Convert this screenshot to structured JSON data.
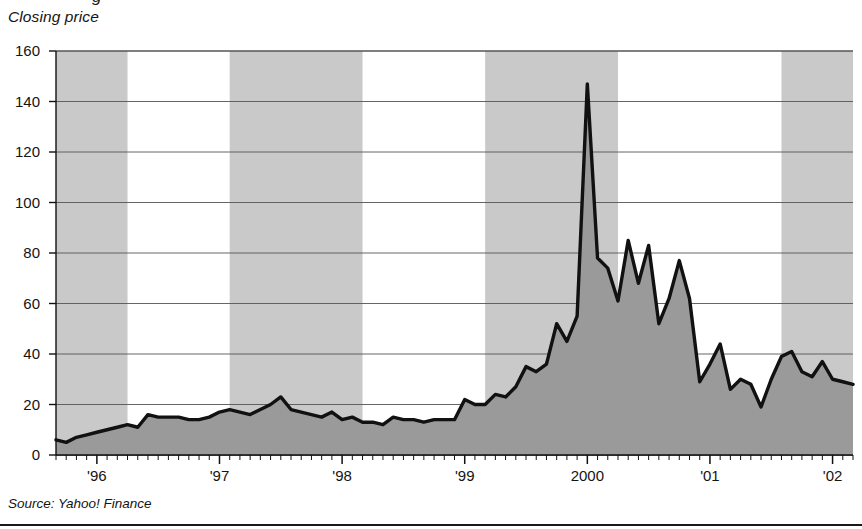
{
  "axis_label": "Closing price",
  "source": "Source: Yahoo! Finance",
  "yticks": [
    "0",
    "20",
    "40",
    "60",
    "80",
    "100",
    "120",
    "140",
    "160"
  ],
  "xticks": [
    "'96",
    "'97",
    "'98",
    "'99",
    "2000",
    "'01",
    "'02"
  ],
  "colors": {
    "band": "#c9c9c9",
    "area_fill": "#9a9a9a",
    "line": "#111111",
    "gridline": "#555555",
    "axis": "#111111",
    "text": "#141414",
    "background": "#ffffff"
  },
  "chart_data": {
    "type": "area",
    "title": "Closing price",
    "xlabel": "",
    "ylabel": "Closing price",
    "ylim": [
      0,
      160
    ],
    "ytick_values": [
      0,
      20,
      40,
      60,
      80,
      100,
      120,
      140,
      160
    ],
    "grid": true,
    "legend": "none",
    "xlim": [
      "1995-09",
      "2002-03"
    ],
    "xtick_labels": [
      "'96",
      "'97",
      "'98",
      "'99",
      "2000",
      "'01",
      "'02"
    ],
    "xtick_positions": [
      "1996-01",
      "1997-01",
      "1998-01",
      "1999-01",
      "2000-01",
      "2001-01",
      "2002-01"
    ],
    "shaded_bands": [
      {
        "start": "1995-09",
        "end": "1996-04"
      },
      {
        "start": "1997-02",
        "end": "1998-03"
      },
      {
        "start": "1999-03",
        "end": "2000-04"
      },
      {
        "start": "2001-08",
        "end": "2002-03"
      }
    ],
    "x": [
      "1995-09",
      "1995-10",
      "1995-11",
      "1995-12",
      "1996-01",
      "1996-02",
      "1996-03",
      "1996-04",
      "1996-05",
      "1996-06",
      "1996-07",
      "1996-08",
      "1996-09",
      "1996-10",
      "1996-11",
      "1996-12",
      "1997-01",
      "1997-02",
      "1997-03",
      "1997-04",
      "1997-05",
      "1997-06",
      "1997-07",
      "1997-08",
      "1997-09",
      "1997-10",
      "1997-11",
      "1997-12",
      "1998-01",
      "1998-02",
      "1998-03",
      "1998-04",
      "1998-05",
      "1998-06",
      "1998-07",
      "1998-08",
      "1998-09",
      "1998-10",
      "1998-11",
      "1998-12",
      "1999-01",
      "1999-02",
      "1999-03",
      "1999-04",
      "1999-05",
      "1999-06",
      "1999-07",
      "1999-08",
      "1999-09",
      "1999-10",
      "1999-11",
      "1999-12",
      "2000-01",
      "2000-02",
      "2000-03",
      "2000-04",
      "2000-05",
      "2000-06",
      "2000-07",
      "2000-08",
      "2000-09",
      "2000-10",
      "2000-11",
      "2000-12",
      "2001-01",
      "2001-02",
      "2001-03",
      "2001-04",
      "2001-05",
      "2001-06",
      "2001-07",
      "2001-08",
      "2001-09",
      "2001-10",
      "2001-11",
      "2001-12",
      "2002-01",
      "2002-02",
      "2002-03"
    ],
    "values": [
      6,
      5,
      7,
      8,
      9,
      10,
      11,
      12,
      11,
      16,
      15,
      15,
      15,
      14,
      14,
      15,
      17,
      18,
      17,
      16,
      18,
      20,
      23,
      18,
      17,
      16,
      15,
      17,
      14,
      15,
      13,
      13,
      12,
      15,
      14,
      14,
      13,
      14,
      14,
      14,
      22,
      20,
      20,
      24,
      23,
      27,
      35,
      33,
      36,
      52,
      45,
      55,
      147,
      78,
      74,
      61,
      85,
      68,
      83,
      52,
      62,
      77,
      62,
      29,
      36,
      44,
      26,
      30,
      28,
      19,
      30,
      39,
      41,
      33,
      31,
      37,
      30,
      29,
      28
    ]
  }
}
